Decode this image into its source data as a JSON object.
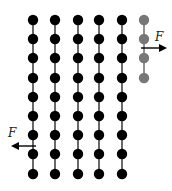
{
  "diagram": {
    "columns_x": [
      33,
      55,
      78,
      99,
      122
    ],
    "rows_y": [
      20,
      39,
      58,
      78,
      97,
      116,
      135,
      154,
      174
    ],
    "dot_radius": 5.2,
    "dot_color": "#000000",
    "link_color": "#444444",
    "partial_column": {
      "x": 144,
      "rows_y": [
        20,
        39,
        58,
        78
      ],
      "color": "#777777"
    },
    "forces": [
      {
        "label": "F",
        "direction": "right",
        "x1": 141,
        "y1": 48,
        "x2": 165,
        "y2": 48,
        "label_x": 155,
        "label_y": 30
      },
      {
        "label": "F",
        "direction": "left",
        "x1": 36,
        "y1": 146,
        "x2": 13,
        "y2": 146,
        "label_x": 8,
        "label_y": 126
      }
    ]
  }
}
